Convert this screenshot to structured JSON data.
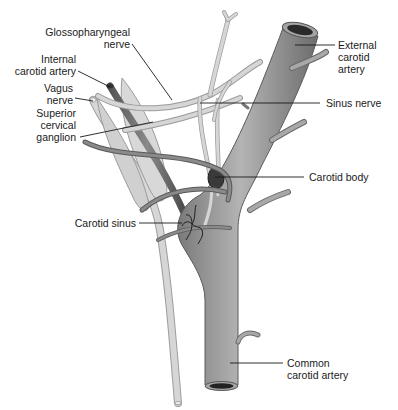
{
  "diagram": {
    "labels": {
      "glossopharyngeal_nerve": "Glossopharyngeal\nnerve",
      "internal_carotid_artery": "Internal\ncarotid artery",
      "vagus_nerve": "Vagus\nnerve",
      "superior_cervical_ganglion": "Superior\ncervical\nganglion",
      "external_carotid_artery": "External\ncarotid\nartery",
      "sinus_nerve": "Sinus nerve",
      "carotid_body": "Carotid body",
      "carotid_sinus": "Carotid sinus",
      "common_carotid_artery": "Common\ncarotid artery"
    },
    "colors": {
      "artery_fill": "#9a9a9a",
      "artery_dark": "#5e5e5e",
      "nerve_fill": "#d4d4d4",
      "nerve_edge": "#9c9c9c",
      "carotid_body": "#3a3a3a",
      "leader_line": "#1a1a1a"
    }
  }
}
